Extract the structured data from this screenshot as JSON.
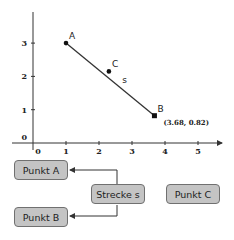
{
  "chart_data": {
    "type": "scatter",
    "title": "",
    "xlabel": "",
    "ylabel": "",
    "xlim": [
      0,
      5.8
    ],
    "ylim": [
      0,
      3.9
    ],
    "x_ticks": [
      "0",
      "1",
      "2",
      "3",
      "4",
      "5"
    ],
    "y_ticks": [
      "0",
      "1",
      "2",
      "3"
    ],
    "points": [
      {
        "name": "A",
        "x": 1.0,
        "y": 3.0
      },
      {
        "name": "B",
        "x": 3.68,
        "y": 0.82
      },
      {
        "name": "C",
        "x": 2.3,
        "y": 2.15
      }
    ],
    "segments": [
      {
        "name": "s",
        "from": "A",
        "to": "B"
      }
    ],
    "annotation": "(3.68, 0.82)"
  },
  "tree": {
    "nodes": {
      "punkt_a": "Punkt A",
      "punkt_b": "Punkt B",
      "punkt_c": "Punkt C",
      "strecke_s": "Strecke s"
    },
    "edges": [
      {
        "from": "Strecke s",
        "to": "Punkt A"
      },
      {
        "from": "Strecke s",
        "to": "Punkt B"
      }
    ]
  },
  "colors": {
    "node_fill": "#c4c4c4",
    "node_border": "#707070",
    "line": "#333333"
  }
}
